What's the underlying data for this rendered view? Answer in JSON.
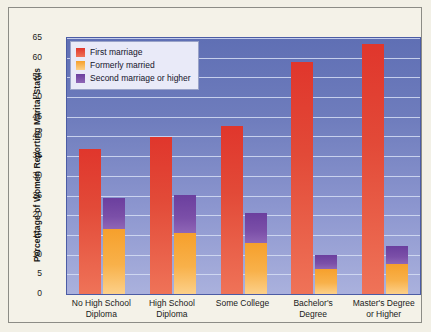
{
  "chart_data": {
    "type": "bar",
    "title": "",
    "xlabel": "",
    "ylabel": "Percentage of Women Reporting Marital Status",
    "ylim": [
      0,
      65
    ],
    "yticks": [
      0,
      5,
      10,
      15,
      20,
      25,
      30,
      35,
      40,
      45,
      50,
      55,
      60,
      65
    ],
    "grid": true,
    "legend_position": "top-left",
    "stacked": true,
    "categories": [
      "No High School\nDiploma",
      "High School\nDiploma",
      "Some College",
      "Bachelor's\nDegree",
      "Master's Degree\nor Higher"
    ],
    "series": [
      {
        "name": "First marriage",
        "color": "#e0362c",
        "values": [
          36.8,
          39.9,
          42.6,
          58.8,
          63.6
        ]
      },
      {
        "name": "Formerly married",
        "color": "#f6a02c",
        "values": [
          16.5,
          15.6,
          13.0,
          6.4,
          7.5
        ]
      },
      {
        "name": "Second marriage or higher",
        "color": "#7b4fa8",
        "values": [
          7.8,
          9.5,
          7.5,
          3.6,
          4.7
        ]
      }
    ],
    "stack_totals": [
      24.3,
      25.1,
      20.5,
      10.0,
      12.2
    ]
  },
  "legend": {
    "items": [
      {
        "label": "First marriage",
        "swatch": "red-swatch"
      },
      {
        "label": "Formerly married",
        "swatch": "orange-swatch"
      },
      {
        "label": "Second marriage or higher",
        "swatch": "purple-swatch"
      }
    ]
  }
}
